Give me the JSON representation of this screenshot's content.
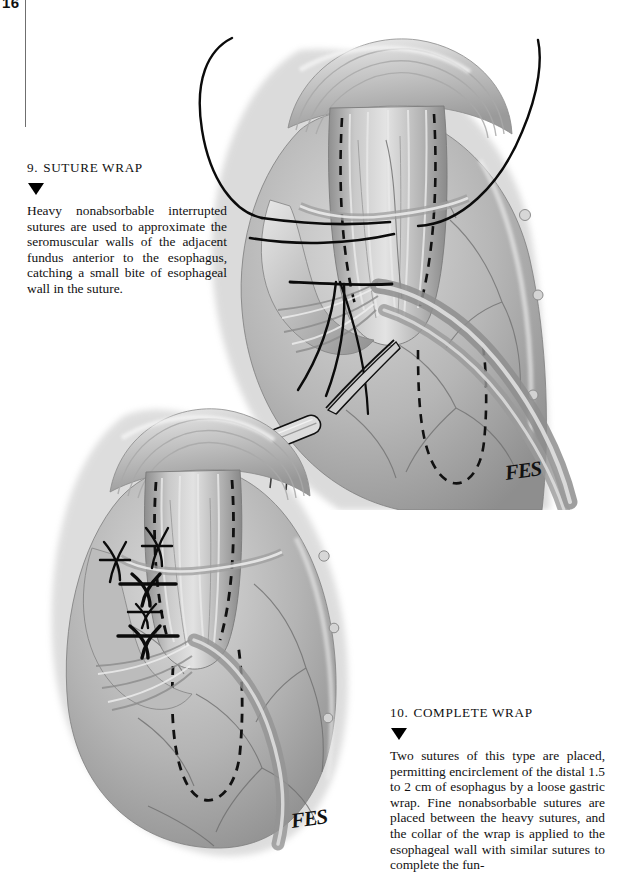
{
  "page": {
    "folio": "16",
    "background_color": "#ffffff",
    "ink_color": "#111111"
  },
  "sections": [
    {
      "number": "9.",
      "title": "SUTURE WRAP",
      "marker": "down-triangle",
      "body": "Heavy nonabsorbable interrupted sutures are used to approximate the seromuscular walls of the adjacent fundus anterior to the esophagus, catching a small bite of esophageal wall in the suture."
    },
    {
      "number": "10.",
      "title": "COMPLETE WRAP",
      "marker": "down-triangle",
      "body": "Two sutures of this type are placed, permitting encirclement of the distal 1.5 to 2 cm of esophagus by a loose gastric wrap. Fine nonabsorbable sutures are placed between the heavy sutures, and the collar of the wrap is applied to the esophageal wall with similar sutures to complete the fun-"
    }
  ],
  "illustrations": [
    {
      "id": "upper",
      "caption_ref": "9. SUTURE WRAP",
      "signature": "FES",
      "subject": "esophagus with gastric fundus, two heavy sutures passed and tied anterior to esophagus, needle holder grasping suture ends",
      "elements": [
        "esophagus",
        "gastric-fundus",
        "seromuscular-wall",
        "suture-thread-left",
        "suture-thread-right",
        "dashed-outline-esophagus",
        "dashed-outline-fundus",
        "needle-holder-clamp",
        "serosal-vessels"
      ]
    },
    {
      "id": "lower",
      "caption_ref": "10. COMPLETE WRAP",
      "signature": "FES",
      "subject": "completed loose gastric wrap with heavy and fine interrupted sutures tied across the collar",
      "elements": [
        "esophagus",
        "gastric-fundus",
        "heavy-suture-knot-1",
        "heavy-suture-knot-2",
        "fine-suture-row",
        "dashed-outline-esophagus",
        "serosal-vessels"
      ]
    }
  ],
  "signature": {
    "text": "FES"
  }
}
